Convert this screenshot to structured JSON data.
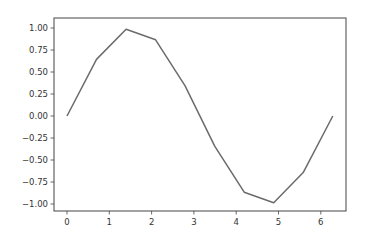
{
  "chart_data": {
    "type": "line",
    "title": "",
    "xlabel": "",
    "ylabel": "",
    "xlim": [
      -0.314,
      6.597
    ],
    "ylim": [
      -1.1,
      1.1
    ],
    "grid": false,
    "legend": null,
    "x_ticks": [
      0,
      1,
      2,
      3,
      4,
      5,
      6
    ],
    "x_tick_labels": [
      "0",
      "1",
      "2",
      "3",
      "4",
      "5",
      "6"
    ],
    "y_ticks": [
      1.0,
      0.75,
      0.5,
      0.25,
      0.0,
      -0.25,
      -0.5,
      -0.75,
      -1.0
    ],
    "y_tick_labels": [
      "1.00",
      "0.75",
      "0.50",
      "0.25",
      "0.00",
      "−0.25",
      "−0.50",
      "−0.75",
      "−1.00"
    ],
    "series": [
      {
        "name": "sin(x)",
        "color": "#6b6b6b",
        "x": [
          0.0,
          0.698,
          1.396,
          2.094,
          2.793,
          3.491,
          4.189,
          4.887,
          5.585,
          6.283
        ],
        "values": [
          0.0,
          0.643,
          0.985,
          0.866,
          0.342,
          -0.342,
          -0.866,
          -0.985,
          -0.643,
          0.0
        ]
      }
    ]
  },
  "style": {
    "spine_color": "#444444",
    "line_color": "#6b6b6b"
  }
}
